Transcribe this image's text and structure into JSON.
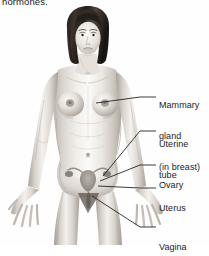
{
  "figure": {
    "caption_fragment": "hormones.",
    "colors": {
      "background": "#fefefe",
      "skin_light": "#f2efec",
      "skin_mid": "#d8d3cd",
      "skin_shadow": "#b6afa8",
      "skin_deep": "#8e8781",
      "hair_dark": "#2b2622",
      "hair_mid": "#4a423b",
      "leader_line": "#1a1a1a",
      "text": "#1c1c1c",
      "organ_tint": "#9a938c"
    }
  },
  "labels": [
    {
      "id": "mammary-gland",
      "lines": [
        "Mammary",
        "gland",
        "(in breast)"
      ],
      "text_x": 159,
      "text_y": 84,
      "leader": {
        "from_x": 96,
        "from_y": 103,
        "mid_x": 140,
        "mid_y": 97,
        "to_x": 156,
        "to_y": 97
      }
    },
    {
      "id": "uterine-tube",
      "lines": [
        "Uterine",
        "tube"
      ],
      "text_x": 159,
      "text_y": 122,
      "leader": {
        "from_x": 103,
        "from_y": 176,
        "mid_x": 140,
        "mid_y": 131,
        "to_x": 156,
        "to_y": 131
      }
    },
    {
      "id": "ovary",
      "lines": [
        "Ovary"
      ],
      "text_x": 159,
      "text_y": 160,
      "leader": {
        "from_x": 100,
        "from_y": 181,
        "mid_x": 140,
        "mid_y": 165,
        "to_x": 156,
        "to_y": 165
      }
    },
    {
      "id": "uterus",
      "lines": [
        "Uterus"
      ],
      "text_x": 159,
      "text_y": 183,
      "leader": {
        "from_x": 98,
        "from_y": 186,
        "mid_x": 140,
        "mid_y": 188,
        "to_x": 156,
        "to_y": 188
      }
    },
    {
      "id": "vagina",
      "lines": [
        "Vagina"
      ],
      "text_x": 159,
      "text_y": 222,
      "leader": {
        "from_x": 92,
        "from_y": 196,
        "mid_x": 140,
        "mid_y": 227,
        "to_x": 156,
        "to_y": 227
      }
    }
  ],
  "body_parts": [
    {
      "id": "head",
      "name": "head-with-bob-haircut"
    },
    {
      "id": "hair",
      "name": "dark-bob-hair"
    },
    {
      "id": "face",
      "name": "face"
    },
    {
      "id": "neck",
      "name": "neck"
    },
    {
      "id": "torso",
      "name": "torso"
    },
    {
      "id": "left-breast",
      "name": "left-breast"
    },
    {
      "id": "right-breast",
      "name": "right-breast"
    },
    {
      "id": "left-arm",
      "name": "left-arm"
    },
    {
      "id": "right-arm",
      "name": "right-arm"
    },
    {
      "id": "left-hand",
      "name": "left-hand"
    },
    {
      "id": "right-hand",
      "name": "right-hand"
    },
    {
      "id": "pelvis",
      "name": "pelvis"
    },
    {
      "id": "left-leg",
      "name": "left-leg"
    },
    {
      "id": "right-leg",
      "name": "right-leg"
    },
    {
      "id": "uterus-organ",
      "name": "uterus-organ-overlay"
    },
    {
      "id": "ovary-left",
      "name": "left-ovary-organ-overlay"
    },
    {
      "id": "ovary-right",
      "name": "right-ovary-organ-overlay"
    },
    {
      "id": "vagina-organ",
      "name": "vagina-organ-overlay"
    }
  ]
}
